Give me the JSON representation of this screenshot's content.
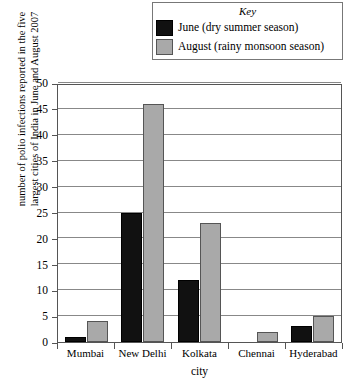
{
  "legend": {
    "title": "Key",
    "entries": [
      {
        "label": "June (dry summer season)",
        "swatch": "black-square-icon",
        "color": "#111111"
      },
      {
        "label": "August (rainy monsoon season)",
        "swatch": "gray-square-icon",
        "color": "#a9a9a9"
      }
    ]
  },
  "axis": {
    "y_title_line1": "number of polio infections reported in the five",
    "y_title_line2": "largest cities of India in June and August 2007",
    "x_title": "city"
  },
  "chart_data": {
    "type": "bar",
    "title": "",
    "xlabel": "city",
    "ylabel": "number of polio infections reported in the five largest cities of India in June and August 2007",
    "categories": [
      "Mumbai",
      "New Delhi",
      "Kolkata",
      "Chennai",
      "Hyderabad"
    ],
    "series": [
      {
        "name": "June (dry summer season)",
        "color": "#111111",
        "values": [
          1,
          25,
          12,
          0,
          3
        ]
      },
      {
        "name": "August (rainy monsoon season)",
        "color": "#a9a9a9",
        "values": [
          4,
          46,
          23,
          2,
          5
        ]
      }
    ],
    "ylim": [
      0,
      50
    ],
    "ytick_step": 5,
    "yticks": [
      0,
      5,
      10,
      15,
      20,
      25,
      30,
      35,
      40,
      45,
      50
    ],
    "grid": true,
    "legend_position": "top"
  }
}
